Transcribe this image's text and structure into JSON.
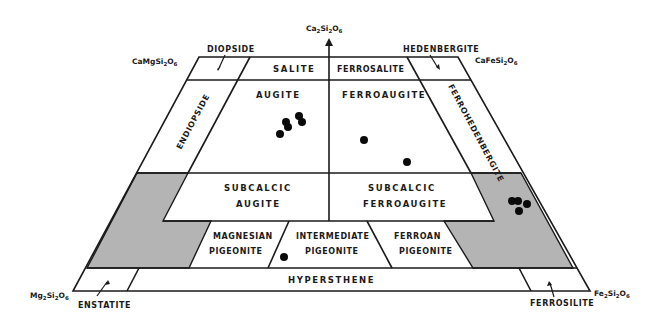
{
  "diagram": {
    "apices": {
      "top_center": "Ca2Si2O6",
      "top_left": "CaMgSi2O6",
      "top_right": "CaFeSi2O6",
      "bottom_left": "Mg2Si2O6",
      "bottom_right": "Fe2Si2O6"
    },
    "end_member_labels": {
      "diopside": "DIOPSIDE",
      "hedenbergite": "HEDENBERGITE",
      "enstatite": "ENSTATITE",
      "ferrosilite": "FERROSILITE"
    },
    "fields": {
      "salite": "SALITE",
      "ferrosalite": "FERROSALITE",
      "augite": "AUGITE",
      "ferroaugite": "FERROAUGITE",
      "endiopside": "ENDIOPSIDE",
      "ferrohedenbergite": "FERROHEDENBERGITE",
      "subcalcic_augite_1": "SUBCALCIC",
      "subcalcic_augite_2": "AUGITE",
      "subcalcic_ferroaugite_1": "SUBCALCIC",
      "subcalcic_ferroaugite_2": "FERROAUGITE",
      "magnesian_pigeonite_1": "MAGNESIAN",
      "magnesian_pigeonite_2": "PIGEONITE",
      "intermediate_pigeonite_1": "INTERMEDIATE",
      "intermediate_pigeonite_2": "PIGEONITE",
      "ferroan_pigeonite_1": "FERROAN",
      "ferroan_pigeonite_2": "PIGEONITE",
      "hypersthene": "HYPERSTHENE"
    },
    "colors": {
      "line": "#1a1a1a",
      "shaded_region": "#b4b4b4",
      "data_point": "#0a0a0a",
      "background": "#ffffff"
    },
    "data_points": [
      {
        "x": 280,
        "y": 134,
        "field": "augite"
      },
      {
        "x": 286,
        "y": 122,
        "field": "augite"
      },
      {
        "x": 288,
        "y": 127,
        "field": "augite"
      },
      {
        "x": 299,
        "y": 116,
        "field": "augite"
      },
      {
        "x": 302,
        "y": 122,
        "field": "augite"
      },
      {
        "x": 364,
        "y": 140,
        "field": "ferroaugite"
      },
      {
        "x": 407,
        "y": 162,
        "field": "ferroaugite"
      },
      {
        "x": 284,
        "y": 257,
        "field": "intermediate pigeonite"
      },
      {
        "x": 512,
        "y": 201,
        "field": "shaded (Fe-rich)"
      },
      {
        "x": 518,
        "y": 201,
        "field": "shaded (Fe-rich)"
      },
      {
        "x": 527,
        "y": 204,
        "field": "shaded (Fe-rich)"
      },
      {
        "x": 519,
        "y": 211,
        "field": "shaded (Fe-rich)"
      }
    ]
  }
}
